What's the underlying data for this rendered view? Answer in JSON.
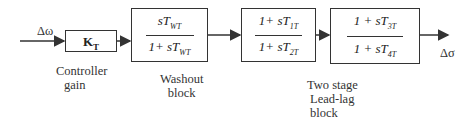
{
  "signals": {
    "input": "Δω",
    "output": "Δσ"
  },
  "blocks": [
    {
      "id": "controller",
      "symbol": "K",
      "symbol_sub": "T",
      "label_lines": [
        "Controller",
        "gain"
      ]
    },
    {
      "id": "washout",
      "num": "sT",
      "num_sub": "WT",
      "den": "1+ sT",
      "den_sub": "WT",
      "label_lines": [
        "Washout",
        "block"
      ]
    },
    {
      "id": "leadlag1",
      "num": "1+ sT",
      "num_sub": "1T",
      "den": "1+ sT",
      "den_sub": "2T"
    },
    {
      "id": "leadlag2",
      "num": "1 + sT",
      "num_sub": "3T",
      "den": "1 + sT",
      "den_sub": "4T"
    }
  ],
  "leadlag_label_lines": [
    "Two stage",
    "Lead-lag",
    "block"
  ],
  "colors": {
    "line": "#333333",
    "background": "#ffffff"
  }
}
